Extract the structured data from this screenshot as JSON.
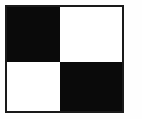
{
  "figure": {
    "width": 142,
    "height": 119
  },
  "frame": {
    "border_color": "#1a1a1a",
    "border_width": 2,
    "background_color": "#ffffff"
  },
  "canvas": {
    "background_color": "#fefefe"
  },
  "pattern": {
    "rows": 2,
    "columns": 2,
    "column_split_percent": 46,
    "row_split_percent": 53,
    "black_color": "#0a0a0a",
    "white_color": "#ffffff",
    "cells": [
      {
        "name": "top-left",
        "fill": "black",
        "label": ""
      },
      {
        "name": "top-right",
        "fill": "white",
        "label": ""
      },
      {
        "name": "bottom-left",
        "fill": "white",
        "label": ""
      },
      {
        "name": "bottom-right",
        "fill": "black",
        "label": ""
      }
    ]
  }
}
